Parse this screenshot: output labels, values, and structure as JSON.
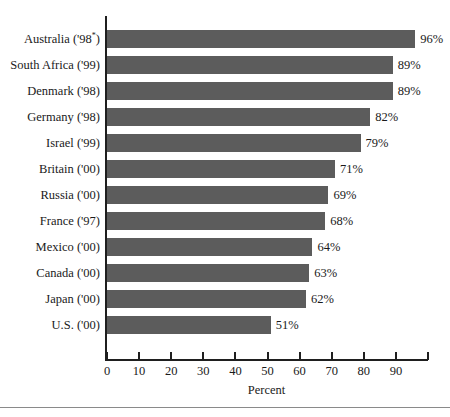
{
  "chart_data": {
    "type": "bar",
    "orientation": "horizontal",
    "title": "",
    "xlabel": "Percent",
    "ylabel": "",
    "xlim": [
      0,
      100
    ],
    "xticks": [
      0,
      10,
      20,
      30,
      40,
      50,
      60,
      70,
      80,
      90,
      100
    ],
    "xtick_labels": [
      "0",
      "10",
      "20",
      "30",
      "40",
      "50",
      "60",
      "70",
      "80",
      "90",
      ""
    ],
    "grid": false,
    "legend": false,
    "bar_color": "#5c5c5c",
    "categories": [
      "Australia ('98*)",
      "South Africa ('99)",
      "Denmark ('98)",
      "Germany ('98)",
      "Israel ('99)",
      "Britain ('00)",
      "Russia ('00)",
      "France ('97)",
      "Mexico ('00)",
      "Canada ('00)",
      "Japan ('00)",
      "U.S. ('00)"
    ],
    "values": [
      96,
      89,
      89,
      82,
      79,
      71,
      69,
      68,
      64,
      63,
      62,
      51
    ],
    "value_labels": [
      "96%",
      "89%",
      "89%",
      "82%",
      "79%",
      "71%",
      "69%",
      "68%",
      "64%",
      "63%",
      "62%",
      "51%"
    ],
    "bars": [
      {
        "country": "Australia",
        "year": "'98",
        "footnote": "*",
        "label": "Australia ('98*)",
        "value": 96,
        "value_label": "96%"
      },
      {
        "country": "South Africa",
        "year": "'99",
        "footnote": "",
        "label": "South Africa ('99)",
        "value": 89,
        "value_label": "89%"
      },
      {
        "country": "Denmark",
        "year": "'98",
        "footnote": "",
        "label": "Denmark ('98)",
        "value": 89,
        "value_label": "89%"
      },
      {
        "country": "Germany",
        "year": "'98",
        "footnote": "",
        "label": "Germany ('98)",
        "value": 82,
        "value_label": "82%"
      },
      {
        "country": "Israel",
        "year": "'99",
        "footnote": "",
        "label": "Israel ('99)",
        "value": 79,
        "value_label": "79%"
      },
      {
        "country": "Britain",
        "year": "'00",
        "footnote": "",
        "label": "Britain ('00)",
        "value": 71,
        "value_label": "71%"
      },
      {
        "country": "Russia",
        "year": "'00",
        "footnote": "",
        "label": "Russia ('00)",
        "value": 69,
        "value_label": "69%"
      },
      {
        "country": "France",
        "year": "'97",
        "footnote": "",
        "label": "France ('97)",
        "value": 68,
        "value_label": "68%"
      },
      {
        "country": "Mexico",
        "year": "'00",
        "footnote": "",
        "label": "Mexico ('00)",
        "value": 64,
        "value_label": "64%"
      },
      {
        "country": "Canada",
        "year": "'00",
        "footnote": "",
        "label": "Canada ('00)",
        "value": 63,
        "value_label": "63%"
      },
      {
        "country": "Japan",
        "year": "'00",
        "footnote": "",
        "label": "Japan ('00)",
        "value": 62,
        "value_label": "62%"
      },
      {
        "country": "U.S.",
        "year": "'00",
        "footnote": "",
        "label": "U.S. ('00)",
        "value": 51,
        "value_label": "51%"
      }
    ]
  }
}
